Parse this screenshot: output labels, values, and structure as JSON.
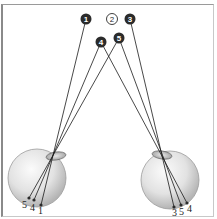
{
  "diagram": {
    "title": "",
    "points": [
      {
        "id": "1",
        "label": "1",
        "x": 86,
        "y": 19,
        "filled": true
      },
      {
        "id": "2",
        "label": "2",
        "x": 112,
        "y": 19,
        "filled": false
      },
      {
        "id": "3",
        "label": "3",
        "x": 130,
        "y": 19,
        "filled": true
      },
      {
        "id": "4",
        "label": "4",
        "x": 101,
        "y": 42,
        "filled": true
      },
      {
        "id": "5",
        "label": "5",
        "x": 119,
        "y": 38,
        "filled": true
      }
    ],
    "left_eye": {
      "retina_labels": [
        "5",
        "4",
        "1"
      ]
    },
    "right_eye": {
      "retina_labels": [
        "3",
        "5",
        "4"
      ]
    },
    "colors": {
      "point_fill": "#2b2b2b",
      "point_text": "#ffffff",
      "ray": "#1a1a1a",
      "eye_light": "#f2f2f2",
      "eye_dark": "#b8b8b8"
    }
  }
}
